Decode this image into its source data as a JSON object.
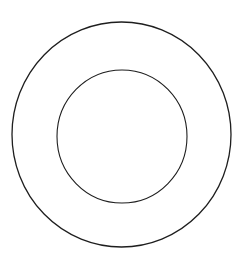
{
  "diagram": {
    "background": "#ffffff",
    "stroke_color": "#1e1e1e",
    "shapes": [
      {
        "id": "outer-circle",
        "type": "ellipse",
        "cx": 121.5,
        "cy": 134.5,
        "rx": 109.5,
        "ry": 112.5,
        "stroke_width": 1.3
      },
      {
        "id": "inner-circle",
        "type": "ellipse",
        "cx": 122,
        "cy": 136.5,
        "rx": 65,
        "ry": 66.5,
        "stroke_width": 1.1
      }
    ]
  }
}
